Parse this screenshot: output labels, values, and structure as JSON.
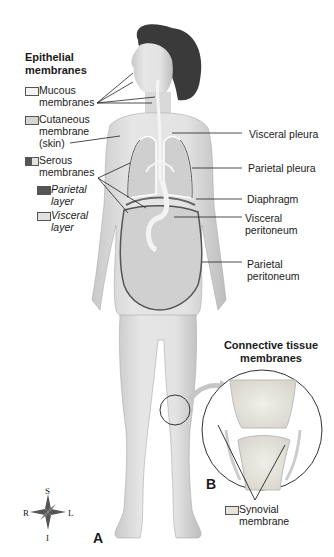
{
  "legend": {
    "title": "Epithelial membranes",
    "title_line1": "Epithelial",
    "title_line2": "membranes",
    "items": [
      {
        "line1": "Mucous",
        "line2": "membranes",
        "swatch": "#f4f4f4"
      },
      {
        "line1": "Cutaneous",
        "line2": "membrane",
        "line3": "(skin)",
        "swatch": "#d6d6d6"
      },
      {
        "line1": "Serous",
        "line2": "membranes",
        "swatch": "split"
      },
      {
        "line1": "Parietal",
        "line2": "layer",
        "swatch": "#555555",
        "italic": true
      },
      {
        "line1": "Visceral",
        "line2": "layer",
        "swatch": "#e2e2e2",
        "italic": true
      }
    ]
  },
  "labels": {
    "visceral_pleura": "Visceral pleura",
    "parietal_pleura": "Parietal pleura",
    "diaphragm": "Diaphragm",
    "visceral_peritoneum_1": "Visceral",
    "visceral_peritoneum_2": "peritoneum",
    "parietal_peritoneum_1": "Parietal",
    "parietal_peritoneum_2": "peritoneum"
  },
  "inset": {
    "title_line1": "Connective tissue",
    "title_line2": "membranes",
    "synovial_line1": "Synovial",
    "synovial_line2": "membrane",
    "panel_label": "B"
  },
  "panel_a_label": "A",
  "compass": {
    "top": "S",
    "bottom": "I",
    "left": "R",
    "right": "L"
  }
}
